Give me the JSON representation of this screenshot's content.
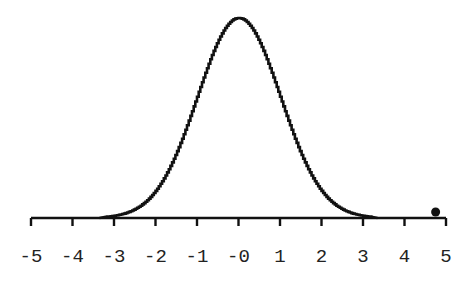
{
  "chart_data": {
    "type": "line",
    "title": "",
    "xlabel": "",
    "ylabel": "",
    "xlim": [
      -5,
      5
    ],
    "grid": false,
    "legend": null,
    "x_ticks": [
      -5,
      -4,
      -3,
      -2,
      -1,
      0,
      1,
      2,
      3,
      4,
      5
    ],
    "x_tick_labels": [
      "-5",
      "-4",
      "-3",
      "-2",
      "-1",
      "-0",
      "1",
      "2",
      "3",
      "4",
      "5"
    ],
    "series": [
      {
        "name": "standard normal density",
        "style": "step",
        "mean": 0,
        "sd": 1,
        "x_range": [
          -3.2,
          3.2
        ]
      }
    ],
    "annotations": [
      {
        "type": "point",
        "x": 4.75,
        "y": 0.015,
        "label": ""
      }
    ]
  }
}
